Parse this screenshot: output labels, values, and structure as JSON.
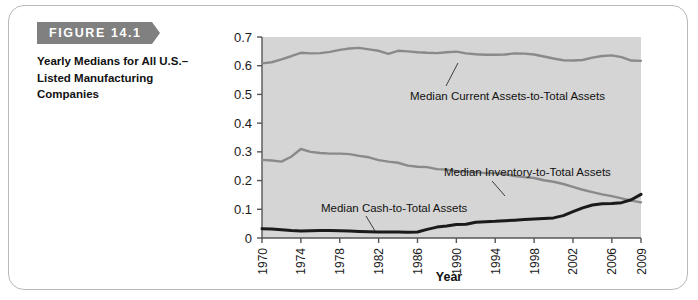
{
  "figure": {
    "banner_label": "FIGURE 14.1",
    "caption": "Yearly Medians for All U.S.–Listed Manufacturing Companies"
  },
  "colors": {
    "banner_background": "#808080",
    "plot_background": "#d5d5d5",
    "current_assets_line": "#8a8a8a",
    "inventory_line": "#8a8a8a",
    "cash_line": "#1a1a1a",
    "axis": "#555555",
    "card_border": "#b9b9b9"
  },
  "chart_data": {
    "type": "line",
    "title": "",
    "xlabel": "Year",
    "ylabel": "",
    "xlim": [
      1970,
      2009
    ],
    "ylim": [
      0,
      0.7
    ],
    "grid": false,
    "legend_position": "inline-annotations",
    "ytick_labels": [
      "0",
      "0.1",
      "0.2",
      "0.3",
      "0.4",
      "0.5",
      "0.6",
      "0.7"
    ],
    "ytick_values": [
      0,
      0.1,
      0.2,
      0.3,
      0.4,
      0.5,
      0.6,
      0.7
    ],
    "xtick_labels": [
      "1970",
      "1974",
      "1978",
      "1982",
      "1986",
      "1990",
      "1994",
      "1998",
      "2002",
      "2006",
      "2009"
    ],
    "xtick_values": [
      1970,
      1974,
      1978,
      1982,
      1986,
      1990,
      1994,
      1998,
      2002,
      2006,
      2009
    ],
    "x": [
      1970,
      1971,
      1972,
      1973,
      1974,
      1975,
      1976,
      1977,
      1978,
      1979,
      1980,
      1981,
      1982,
      1983,
      1984,
      1985,
      1986,
      1987,
      1988,
      1989,
      1990,
      1991,
      1992,
      1993,
      1994,
      1995,
      1996,
      1997,
      1998,
      1999,
      2000,
      2001,
      2002,
      2003,
      2004,
      2005,
      2006,
      2007,
      2008,
      2009
    ],
    "series": [
      {
        "name": "Median Current Assets-to-Total Assets",
        "color": "#8a8a8a",
        "annotation": "Median Current Assets-to-Total Assets",
        "values": [
          0.608,
          0.612,
          0.622,
          0.633,
          0.645,
          0.643,
          0.644,
          0.648,
          0.655,
          0.66,
          0.662,
          0.657,
          0.652,
          0.641,
          0.652,
          0.65,
          0.647,
          0.645,
          0.644,
          0.647,
          0.649,
          0.643,
          0.64,
          0.638,
          0.638,
          0.639,
          0.643,
          0.642,
          0.639,
          0.632,
          0.625,
          0.619,
          0.618,
          0.62,
          0.628,
          0.634,
          0.636,
          0.63,
          0.618,
          0.617
        ]
      },
      {
        "name": "Median Inventory-to-Total Assets",
        "color": "#8a8a8a",
        "annotation": "Median Inventory-to-Total Assets",
        "values": [
          0.272,
          0.27,
          0.266,
          0.283,
          0.31,
          0.3,
          0.296,
          0.294,
          0.294,
          0.292,
          0.286,
          0.281,
          0.271,
          0.266,
          0.262,
          0.252,
          0.248,
          0.247,
          0.24,
          0.238,
          0.233,
          0.231,
          0.229,
          0.226,
          0.226,
          0.222,
          0.216,
          0.212,
          0.209,
          0.201,
          0.196,
          0.188,
          0.178,
          0.168,
          0.16,
          0.152,
          0.146,
          0.138,
          0.13,
          0.124
        ]
      },
      {
        "name": "Median Cash-to-Total Assets",
        "color": "#1a1a1a",
        "annotation": "Median Cash-to-Total Assets",
        "values": [
          0.032,
          0.031,
          0.029,
          0.026,
          0.024,
          0.025,
          0.026,
          0.026,
          0.025,
          0.024,
          0.023,
          0.022,
          0.021,
          0.021,
          0.021,
          0.02,
          0.021,
          0.03,
          0.038,
          0.042,
          0.047,
          0.048,
          0.055,
          0.057,
          0.058,
          0.06,
          0.062,
          0.064,
          0.066,
          0.068,
          0.07,
          0.078,
          0.092,
          0.105,
          0.115,
          0.119,
          0.12,
          0.123,
          0.133,
          0.152
        ]
      }
    ]
  }
}
